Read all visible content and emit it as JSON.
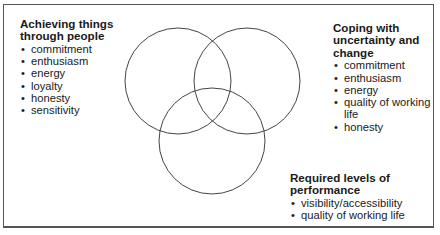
{
  "diagram": {
    "type": "venn",
    "circles": [
      {
        "id": "people",
        "cx": 178,
        "cy": 81,
        "r": 53
      },
      {
        "id": "uncertainty",
        "cx": 247,
        "cy": 81,
        "r": 53
      },
      {
        "id": "performance",
        "cx": 212,
        "cy": 141,
        "r": 53
      }
    ],
    "stroke_color": "#444444"
  },
  "groups": [
    {
      "title": "Achieving things through people",
      "items": [
        "commitment",
        "enthusiasm",
        "energy",
        "loyalty",
        "honesty",
        "sensitivity"
      ]
    },
    {
      "title": "Coping with uncertainty and change",
      "items": [
        "commitment",
        "enthusiasm",
        "energy",
        "quality of working life",
        "honesty"
      ]
    },
    {
      "title": "Required levels of performance",
      "items": [
        "visibility/accessibility",
        "quality of working life"
      ]
    }
  ]
}
